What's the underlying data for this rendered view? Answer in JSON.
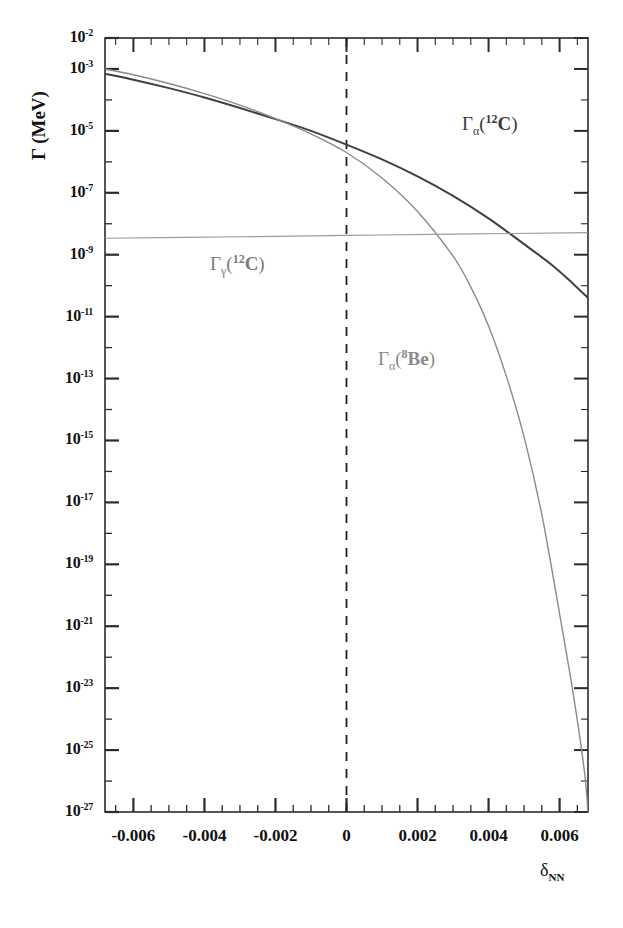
{
  "figure": {
    "background": "#ffffff",
    "plot_box": {
      "left": 105,
      "top": 38,
      "right": 588,
      "bottom": 812
    }
  },
  "axis_titles": {
    "y": "Γ (MeV)",
    "x_symbol": "δ",
    "x_subscript": "NN"
  },
  "annotations": [
    {
      "name": "curve-label-alpha-c12",
      "text_gamma": "Γ",
      "sub": "α",
      "open": "(",
      "sup": "12",
      "nuc": "C",
      "close": ")",
      "x": 462,
      "y": 126,
      "color": "#3a3a3a"
    },
    {
      "name": "curve-label-gamma-c12",
      "text_gamma": "Γ",
      "sub": "γ",
      "open": "(",
      "sup": "12",
      "nuc": "C",
      "close": ")",
      "x": 210,
      "y": 265,
      "color": "#8a8a8a"
    },
    {
      "name": "curve-label-alpha-be8",
      "text_gamma": "Γ",
      "sub": "α",
      "open": "(",
      "sup": "8",
      "nuc": "Be",
      "close": ")",
      "x": 378,
      "y": 360,
      "color": "#8a8a8a"
    }
  ],
  "chart_data": {
    "type": "line",
    "title": "",
    "xlabel": "δ_NN",
    "ylabel": "Γ (MeV)",
    "yscale": "log",
    "ylim": [
      1e-27,
      0.01
    ],
    "xlim": [
      -0.0068,
      0.0068
    ],
    "grid": false,
    "legend": "inline-labels",
    "ytick_labels": [
      "10-2",
      "10-3",
      "10-5",
      "10-7",
      "10-9",
      "10-11",
      "10-13",
      "10-15",
      "10-17",
      "10-19",
      "10-21",
      "10-23",
      "10-25",
      "10-27"
    ],
    "ytick_exponents": [
      -2,
      -3,
      -5,
      -7,
      -9,
      -11,
      -13,
      -15,
      -17,
      -19,
      -21,
      -23,
      -25,
      -27
    ],
    "xtick_labels": [
      "-0.006",
      "-0.004",
      "-0.002",
      "0",
      "0.002",
      "0.004",
      "0.006"
    ],
    "xtick_values": [
      -0.006,
      -0.004,
      -0.002,
      0,
      0.002,
      0.004,
      0.006
    ],
    "xtick_minor_step": 0.0005,
    "reference_line": {
      "name": "delta-zero-dashed-line",
      "x": 0,
      "style": "dashed"
    },
    "series": [
      {
        "name": "Γ_α(12C)",
        "label": "Gamma alpha 12C",
        "color": "#404040",
        "width": 2.0,
        "points": [
          [
            -0.0068,
            0.0007
          ],
          [
            -0.006,
            0.00045
          ],
          [
            -0.005,
            0.00024
          ],
          [
            -0.004,
            0.00012
          ],
          [
            -0.003,
            5.5e-05
          ],
          [
            -0.002,
            2.4e-05
          ],
          [
            -0.001,
            1e-05
          ],
          [
            0.0,
            3.6e-06
          ],
          [
            0.001,
            1.2e-06
          ],
          [
            0.002,
            3.4e-07
          ],
          [
            0.003,
            8e-08
          ],
          [
            0.004,
            1.5e-08
          ],
          [
            0.005,
            2.2e-09
          ],
          [
            0.0058,
            4.5e-10
          ],
          [
            0.0064,
            1.1e-10
          ],
          [
            0.0068,
            4e-11
          ]
        ]
      },
      {
        "name": "Γ_α(8Be)",
        "label": "Gamma alpha 8Be",
        "color": "#8a8a8a",
        "width": 1.4,
        "points": [
          [
            -0.0068,
            0.001
          ],
          [
            -0.006,
            0.00065
          ],
          [
            -0.005,
            0.00034
          ],
          [
            -0.004,
            0.00016
          ],
          [
            -0.003,
            6.8e-05
          ],
          [
            -0.002,
            2.5e-05
          ],
          [
            -0.001,
            8e-06
          ],
          [
            0.0,
            2e-06
          ],
          [
            0.001,
            3e-07
          ],
          [
            0.002,
            2.5e-08
          ],
          [
            0.003,
            9e-10
          ],
          [
            0.0035,
            9e-11
          ],
          [
            0.004,
            5e-12
          ],
          [
            0.0045,
            1.2e-13
          ],
          [
            0.005,
            1.3e-15
          ],
          [
            0.0055,
            4e-18
          ],
          [
            0.006,
            2.5e-21
          ],
          [
            0.0064,
            5e-24
          ],
          [
            0.0067,
            2e-26
          ],
          [
            0.0068,
            1e-27
          ]
        ]
      },
      {
        "name": "Γ_γ(12C)",
        "label": "Gamma gamma 12C",
        "color": "#9a9a9a",
        "width": 1.2,
        "points": [
          [
            -0.0068,
            3.4e-09
          ],
          [
            -0.003,
            3.8e-09
          ],
          [
            0.0,
            4.2e-09
          ],
          [
            0.003,
            4.6e-09
          ],
          [
            0.0068,
            5.2e-09
          ]
        ]
      }
    ]
  }
}
